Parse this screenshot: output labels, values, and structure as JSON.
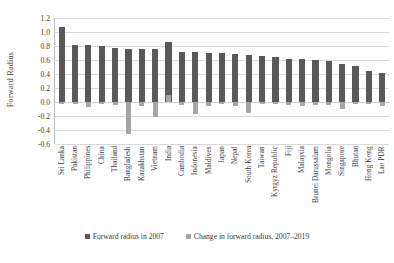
{
  "chart_data": {
    "type": "bar",
    "title": "",
    "xlabel": "",
    "ylabel": "Forward Radius",
    "ylim": [
      -0.6,
      1.2
    ],
    "grid": true,
    "legend_position": "bottom",
    "y_ticks": [
      "1.2",
      "1.0",
      "0.8",
      "0.6",
      "0.4",
      "0.2",
      "0.0",
      "-0.2",
      "-0.4",
      "-0.6"
    ],
    "y_tick_values": [
      1.2,
      1.0,
      0.8,
      0.6,
      0.4,
      0.2,
      0.0,
      -0.2,
      -0.4,
      -0.6
    ],
    "categories": [
      "Sri Lanka",
      "Pakistan",
      "Philippines",
      "China",
      "Thailand",
      "Bangladesh",
      "Kazakhstan",
      "Vietnam",
      "India",
      "Cambodia",
      "Indonesia",
      "Maldives",
      "Japan",
      "Nepal",
      "South Korea",
      "Taiwan",
      "Kyrgyz Republic",
      "Fiji",
      "Malaysia",
      "Brunei Darussalam",
      "Mongolia",
      "Singapore",
      "Bhutan",
      "Hong Kong",
      "Lao PDR"
    ],
    "series": [
      {
        "name": "Forward radius in 2007",
        "color": "#595959",
        "values": [
          1.07,
          0.82,
          0.81,
          0.8,
          0.77,
          0.76,
          0.76,
          0.76,
          0.86,
          0.71,
          0.71,
          0.7,
          0.7,
          0.68,
          0.67,
          0.66,
          0.64,
          0.62,
          0.61,
          0.6,
          0.58,
          0.55,
          0.52,
          0.44,
          0.41
        ]
      },
      {
        "name": "Change in forward radius, 2007–2019",
        "color": "#a6a6a6",
        "values": [
          -0.02,
          -0.03,
          -0.07,
          -0.02,
          -0.04,
          -0.45,
          -0.06,
          -0.22,
          0.1,
          -0.04,
          -0.17,
          -0.05,
          -0.03,
          -0.05,
          -0.15,
          -0.03,
          -0.03,
          -0.04,
          -0.05,
          -0.04,
          -0.04,
          -0.1,
          -0.03,
          -0.03,
          -0.05
        ]
      }
    ]
  },
  "legend": {
    "items": [
      {
        "label": "Forward radius in 2007",
        "color": "#595959"
      },
      {
        "label": "Change in forward radius, 2007–2019",
        "color": "#a6a6a6"
      }
    ]
  },
  "axis": {
    "y_title": "Forward Radius"
  }
}
